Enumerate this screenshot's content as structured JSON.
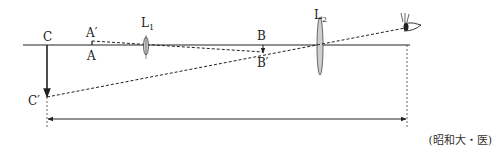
{
  "diagram": {
    "type": "optics-compound-microscope",
    "labels": {
      "C": "C",
      "C_prime": "C′",
      "A": "A",
      "A_prime": "A′",
      "B": "B",
      "B_prime": "B′",
      "L1": "L",
      "L1_sub": "1",
      "L2": "L",
      "L2_sub": "2"
    },
    "source": "(昭和大・医)",
    "colors": {
      "line": "#222222",
      "lens_fill": "#cfcfcf"
    }
  }
}
